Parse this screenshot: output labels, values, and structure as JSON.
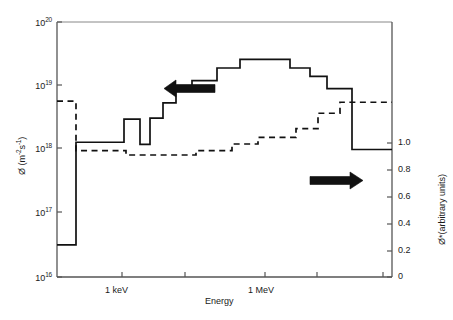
{
  "chart_data": {
    "type": "line",
    "title": "",
    "xlabel": "Energy",
    "ylabel_left": "Ø (m⁻²s⁻¹)",
    "ylabel_right": "Ø*(arbitrary units)",
    "x_axis": {
      "scale": "log",
      "tick_labels": [
        "1 keV",
        "1 MeV"
      ],
      "tick_positions_px": [
        122,
        185,
        265,
        317,
        383
      ],
      "labeled_ticks": [
        {
          "label": "1 keV",
          "x_px": 122
        },
        {
          "label": "1 MeV",
          "x_px": 265
        }
      ]
    },
    "y_axis_left": {
      "scale": "log",
      "tick_labels": [
        "10¹⁶",
        "10¹⁷",
        "10¹⁸",
        "10¹⁹",
        "10²⁰"
      ],
      "tick_mantissa": [
        "10",
        "10",
        "10",
        "10",
        "10"
      ],
      "tick_exponents": [
        "16",
        "17",
        "18",
        "19",
        "20"
      ],
      "ylim": [
        1e+16,
        1e+20
      ]
    },
    "y_axis_right": {
      "scale": "linear",
      "tick_labels": [
        "0",
        "0.2",
        "0.4",
        "0.6",
        "0.8",
        "1.0"
      ],
      "ylim": [
        0,
        1.16
      ]
    },
    "grid": false,
    "legend": "none",
    "annotations": [
      {
        "name": "left-arrow",
        "text": "",
        "points_to": "left-axis",
        "x_px": 190,
        "y_px": 88
      },
      {
        "name": "right-arrow",
        "text": "",
        "points_to": "right-axis",
        "x_px": 337,
        "y_px": 180
      }
    ],
    "series": [
      {
        "name": "flux-spectrum",
        "style": "solid-step",
        "axis": "left",
        "units": "m^-2 s^-1",
        "steps": [
          {
            "x0_px": 57,
            "x1_px": 76,
            "value": 3.2e+16
          },
          {
            "x0_px": 76,
            "x1_px": 124,
            "value": 1.3e+18
          },
          {
            "x0_px": 124,
            "x1_px": 140,
            "value": 3e+18
          },
          {
            "x0_px": 140,
            "x1_px": 150,
            "value": 1.2e+18
          },
          {
            "x0_px": 150,
            "x1_px": 163,
            "value": 3.1e+18
          },
          {
            "x0_px": 163,
            "x1_px": 176,
            "value": 5.4e+18
          },
          {
            "x0_px": 176,
            "x1_px": 192,
            "value": 8.2e+18
          },
          {
            "x0_px": 192,
            "x1_px": 217,
            "value": 1.2e+19
          },
          {
            "x0_px": 217,
            "x1_px": 240,
            "value": 1.9e+19
          },
          {
            "x0_px": 240,
            "x1_px": 290,
            "value": 2.6e+19
          },
          {
            "x0_px": 290,
            "x1_px": 310,
            "value": 1.9e+19
          },
          {
            "x0_px": 310,
            "x1_px": 327,
            "value": 1.4e+19
          },
          {
            "x0_px": 327,
            "x1_px": 352,
            "value": 9e+18
          },
          {
            "x0_px": 352,
            "x1_px": 392,
            "value": 1e+18
          }
        ]
      },
      {
        "name": "adjoint-importance",
        "style": "dashed-step",
        "axis": "right",
        "units": "arbitrary",
        "steps": [
          {
            "x0_px": 57,
            "x1_px": 76,
            "value": 0.8
          },
          {
            "x0_px": 76,
            "x1_px": 126,
            "value": 0.575
          },
          {
            "x0_px": 126,
            "x1_px": 196,
            "value": 0.555
          },
          {
            "x0_px": 196,
            "x1_px": 232,
            "value": 0.575
          },
          {
            "x0_px": 232,
            "x1_px": 258,
            "value": 0.605
          },
          {
            "x0_px": 258,
            "x1_px": 296,
            "value": 0.635
          },
          {
            "x0_px": 296,
            "x1_px": 318,
            "value": 0.675
          },
          {
            "x0_px": 318,
            "x1_px": 340,
            "value": 0.745
          },
          {
            "x0_px": 340,
            "x1_px": 392,
            "value": 0.795
          }
        ]
      }
    ]
  },
  "axes": {
    "left_title": "Ø (m",
    "left_title_exp1": "-2",
    "left_title_mid": "s",
    "left_title_exp2": "-1",
    "left_title_end": ")",
    "right_title": "Ø*(arbitrary units)",
    "x_title": "Energy"
  },
  "ticks_left": [
    {
      "label_base": "10",
      "label_exp": "20",
      "y_px": 22
    },
    {
      "label_base": "10",
      "label_exp": "19",
      "y_px": 85
    },
    {
      "label_base": "10",
      "label_exp": "18",
      "y_px": 148
    },
    {
      "label_base": "10",
      "label_exp": "17",
      "y_px": 212
    },
    {
      "label_base": "10",
      "label_exp": "16",
      "y_px": 277
    }
  ],
  "ticks_right": [
    {
      "label": "1.0",
      "y_px": 143
    },
    {
      "label": "0.8",
      "y_px": 170
    },
    {
      "label": "0.6",
      "y_px": 197
    },
    {
      "label": "0.4",
      "y_px": 224
    },
    {
      "label": "0.2",
      "y_px": 251
    },
    {
      "label": "0",
      "y_px": 277
    }
  ],
  "ticks_x": [
    {
      "label": "1 keV",
      "x_px": 122
    },
    {
      "label": "",
      "x_px": 185
    },
    {
      "label": "1 MeV",
      "x_px": 265
    },
    {
      "label": "",
      "x_px": 317
    },
    {
      "label": "",
      "x_px": 383
    }
  ],
  "colors": {
    "line": "#111111",
    "axis": "#555555",
    "text": "#1a1a1a",
    "background": "#ffffff"
  }
}
